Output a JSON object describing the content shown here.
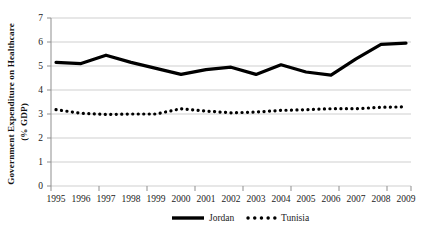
{
  "chart_data": {
    "type": "line",
    "title": "",
    "subtitle": "",
    "xlabel": "",
    "ylabel": "Government Expenditure on Healthcare (% GDP)",
    "ylabel_line1": "Government Expenditure on Healthcare",
    "ylabel_line2": "(% GDP)",
    "x": [
      1995,
      1996,
      1997,
      1998,
      1999,
      2000,
      2001,
      2002,
      2003,
      2004,
      2005,
      2006,
      2007,
      2008,
      2009
    ],
    "categories": [
      "1995",
      "1996",
      "1997",
      "1998",
      "1999",
      "2000",
      "2001",
      "2002",
      "2003",
      "2004",
      "2005",
      "2006",
      "2007",
      "2008",
      "2009"
    ],
    "xtick_labels": [
      "1995",
      "1996",
      "1997",
      "1998",
      "1999",
      "2000",
      "2001",
      "2002",
      "2003",
      "2004",
      "2005",
      "2006",
      "2007",
      "2008",
      "2009"
    ],
    "ytick_labels": [
      "0",
      "1",
      "2",
      "3",
      "4",
      "5",
      "6",
      "7"
    ],
    "ytick_values": [
      0,
      1,
      2,
      3,
      4,
      5,
      6,
      7
    ],
    "ylim": [
      0,
      7
    ],
    "xlim": [
      1995,
      2009
    ],
    "grid": "horizontal",
    "legend_position": "bottom-center",
    "series": [
      {
        "name": "Jordan",
        "style": "solid",
        "color": "#000000",
        "line_width": 3.2,
        "values": [
          5.15,
          5.1,
          5.45,
          5.15,
          4.9,
          4.65,
          4.85,
          4.95,
          4.65,
          5.05,
          4.75,
          4.62,
          5.3,
          5.9,
          5.95
        ]
      },
      {
        "name": "Tunisia",
        "style": "dotted",
        "color": "#000000",
        "line_width": 3.2,
        "values": [
          3.18,
          3.03,
          2.98,
          3.0,
          3.0,
          3.22,
          3.12,
          3.05,
          3.08,
          3.15,
          3.18,
          3.22,
          3.22,
          3.28,
          3.3
        ]
      }
    ],
    "legend": [
      {
        "label": "Jordan",
        "style": "solid"
      },
      {
        "label": "Tunisia",
        "style": "dotted"
      }
    ]
  },
  "colors": {
    "series_primary": "#000000",
    "grid": "#c9c9c9",
    "axis": "#8c8c8c",
    "background": "#ffffff",
    "text": "#1a1a1a"
  }
}
